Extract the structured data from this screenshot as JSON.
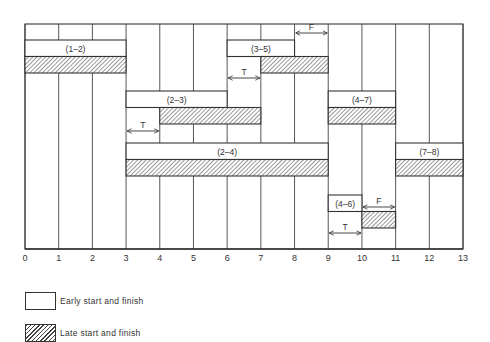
{
  "chart_data": {
    "type": "gantt",
    "title": "",
    "xlabel": "",
    "ylabel": "",
    "x_ticks": [
      0,
      1,
      2,
      3,
      4,
      5,
      6,
      7,
      8,
      9,
      10,
      11,
      12,
      13
    ],
    "xlim": [
      0,
      13
    ],
    "grid": "vertical",
    "activities": [
      {
        "label": "(1–2)",
        "early": [
          0,
          3
        ],
        "late": [
          0,
          3
        ]
      },
      {
        "label": "(3–5)",
        "early": [
          6,
          8
        ],
        "late": [
          7,
          9
        ]
      },
      {
        "label": "(2–3)",
        "early": [
          3,
          6
        ],
        "late": [
          4,
          7
        ]
      },
      {
        "label": "(4–7)",
        "early": [
          9,
          11
        ],
        "late": [
          9,
          11
        ]
      },
      {
        "label": "(2–4)",
        "early": [
          3,
          9
        ],
        "late": [
          3,
          9
        ]
      },
      {
        "label": "(7–8)",
        "early": [
          11,
          13
        ],
        "late": [
          11,
          13
        ]
      },
      {
        "label": "(4–6)",
        "early": [
          9,
          10
        ],
        "late": [
          10,
          11
        ]
      }
    ],
    "annotations": [
      {
        "text": "F",
        "from": 8,
        "to": 9,
        "meaning": "free float",
        "row": "(3–5)"
      },
      {
        "text": "T",
        "from": 6,
        "to": 7,
        "meaning": "total float",
        "row": "(3–5)"
      },
      {
        "text": "T",
        "from": 3,
        "to": 4,
        "meaning": "total float",
        "row": "(2–3)"
      },
      {
        "text": "F",
        "from": 10,
        "to": 11,
        "meaning": "free float",
        "row": "(4–6)"
      },
      {
        "text": "T",
        "from": 9,
        "to": 10,
        "meaning": "total float",
        "row": "(4–6)"
      }
    ],
    "legend": [
      {
        "key": "early",
        "label": "Early start and finish",
        "style": "open"
      },
      {
        "key": "late",
        "label": "Late start and finish",
        "style": "hatched"
      }
    ]
  },
  "legend": {
    "early_label": "Early start and finish",
    "late_label": "Late start and finish"
  },
  "colors": {
    "line": "#333333",
    "hatch": "#444444",
    "background": "#ffffff"
  }
}
